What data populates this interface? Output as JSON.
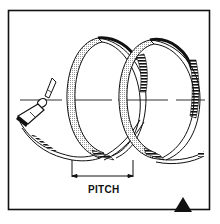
{
  "diagram": {
    "labels": {
      "pitch": "PITCH"
    },
    "elements": [
      "frame",
      "propeller",
      "axis-line",
      "helix-coil-1",
      "helix-coil-2",
      "pitch-dimension",
      "corner-triangle-marker"
    ],
    "colors": {
      "stroke": "#111111",
      "fill_light": "#d9d9d9",
      "background": "#ffffff"
    }
  }
}
